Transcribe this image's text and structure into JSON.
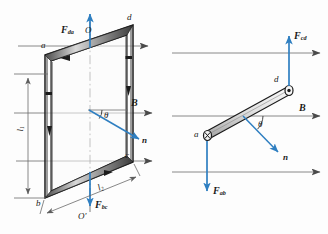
{
  "figure": {
    "type": "physics-diagram",
    "colors": {
      "force_vector": "#2f7fc1",
      "normal_vector": "#2f7fc1",
      "field_line": "#6b6b6b",
      "loop_outline": "#1a1a1a",
      "axis_dashdot": "#555555",
      "dimension_line": "#6b6b6b",
      "background": "#fdfdfd"
    },
    "left_view": {
      "name": "perspective-view",
      "vertices": [
        {
          "id": "a",
          "label": "a",
          "x": 44,
          "y": 47
        },
        {
          "id": "d",
          "label": "d",
          "x": 129,
          "y": 19
        },
        {
          "id": "b",
          "label": "b",
          "x": 38,
          "y": 205
        },
        {
          "id": "c",
          "label": "c",
          "x": 129,
          "y": 156
        }
      ],
      "axis_top_label": "O",
      "axis_bottom_label": "O'",
      "force_top": {
        "label": "F",
        "sub": "da",
        "direction": "up"
      },
      "force_bottom": {
        "label": "F",
        "sub": "bc",
        "direction": "down"
      },
      "field_label": "B",
      "normal_label": "n",
      "angle_label": "θ",
      "dim_vertical": {
        "label": "l",
        "sub": "1"
      },
      "dim_diagonal": {
        "label": "l",
        "sub": "2"
      }
    },
    "right_view": {
      "name": "top-down-view",
      "endpoints": [
        {
          "id": "d",
          "label": "d",
          "marker": "dot-in-circle",
          "meaning": "current out of page"
        },
        {
          "id": "a",
          "label": "a",
          "marker": "cross-in-circle",
          "meaning": "current into page"
        }
      ],
      "force_top": {
        "label": "F",
        "sub": "cd",
        "direction": "up"
      },
      "force_bottom": {
        "label": "F",
        "sub": "ab",
        "direction": "down"
      },
      "field_label": "B",
      "normal_label": "n",
      "angle_label": "θ"
    }
  }
}
